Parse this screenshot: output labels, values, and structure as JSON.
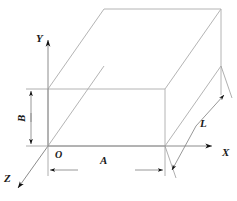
{
  "figure": {
    "type": "3d-rectangular-box-oblique-projection",
    "background_color": "#ffffff",
    "line_color": "#9a9a9a",
    "axis_color": "#808080",
    "label_color": "#1a1a1a",
    "dimension_color": "#111111"
  },
  "axes": [
    {
      "name": "y-axis",
      "label": "Y",
      "direction": "up",
      "label_x": 36,
      "label_y": 33
    },
    {
      "name": "x-axis",
      "label": "X",
      "direction": "right",
      "label_x": 222,
      "label_y": 147
    },
    {
      "name": "z-axis",
      "label": "Z",
      "direction": "down-left",
      "label_x": 4,
      "label_y": 173
    }
  ],
  "origin": {
    "label": "O",
    "x": 55,
    "y": 150
  },
  "dimensions": [
    {
      "name": "width-dimension",
      "label": "A",
      "orientation": "horizontal",
      "label_x": 100,
      "label_y": 155
    },
    {
      "name": "height-dimension",
      "label": "B",
      "orientation": "vertical",
      "label_x": 16,
      "label_y": 122
    },
    {
      "name": "depth-dimension",
      "label": "L",
      "orientation": "diagonal",
      "label_x": 200,
      "label_y": 118
    }
  ],
  "geometry": {
    "front_face": {
      "left": 48,
      "top": 89,
      "right": 165,
      "bottom": 146
    },
    "depth_offset": {
      "dx": 56,
      "dy": -80
    },
    "back_face": {
      "left": 104,
      "top": 9,
      "right": 221,
      "bottom": 66
    }
  }
}
